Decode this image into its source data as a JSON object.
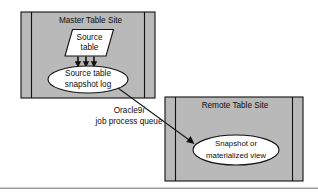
{
  "diagram": {
    "background_color": "#ffffff",
    "site_fill_color": "#b9b9b9",
    "node_fill_color": "#ffffff",
    "line_color": "#111111",
    "footer_rule_color": "#5d5d5d",
    "master_site": {
      "title": "Master Table Site",
      "source_table": {
        "label_line1": "Source",
        "label_line2": "table",
        "shape": "parallelogram"
      },
      "snapshot_log": {
        "label_line1": "Source table",
        "label_line2": "snapshot log",
        "shape": "ellipse"
      },
      "feed_arrows": {
        "count": 3,
        "direction": "down"
      }
    },
    "remote_site": {
      "title": "Remote Table Site",
      "snapshot": {
        "label_line1": "Snapshot or",
        "label_line2": "materialized view",
        "shape": "ellipse"
      }
    },
    "queue_connector": {
      "label_line1_prefix": "Oracle9",
      "label_line1_italic": "i",
      "label_line2": "job process queue",
      "direction": "master-to-remote"
    }
  }
}
